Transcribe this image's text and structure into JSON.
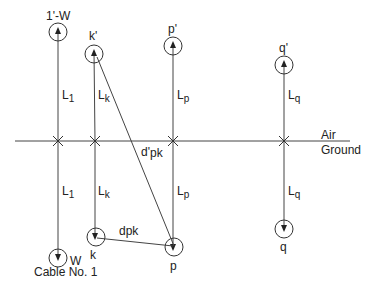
{
  "diagram": {
    "colors": {
      "line": "#333333",
      "text": "#222222",
      "background": "#ffffff"
    },
    "interface": {
      "air_label": "Air",
      "ground_label": "Ground"
    },
    "conductors": [
      {
        "id": "W",
        "image_label": "1'-W",
        "real_label": "W",
        "length_label_main": "L",
        "length_label_sub": "1",
        "caption": "Cable No. 1"
      },
      {
        "id": "k",
        "image_label": "k'",
        "real_label": "k",
        "length_label_main": "L",
        "length_label_sub": "k"
      },
      {
        "id": "p",
        "image_label": "p'",
        "real_label": "p",
        "length_label_main": "L",
        "length_label_sub": "p"
      },
      {
        "id": "q",
        "image_label": "q'",
        "real_label": "q",
        "length_label_main": "L",
        "length_label_sub": "q"
      }
    ],
    "distances": {
      "image_distance_main": "d'",
      "image_distance_sub": "pk",
      "real_distance_main": "d",
      "real_distance_sub": "pk"
    }
  }
}
